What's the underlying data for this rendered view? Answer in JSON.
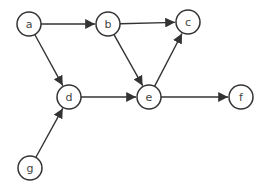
{
  "diagram": {
    "type": "directed-graph",
    "nodes": [
      {
        "id": "a",
        "label": "a",
        "x": 29,
        "y": 24
      },
      {
        "id": "b",
        "label": "b",
        "x": 108,
        "y": 24
      },
      {
        "id": "c",
        "label": "c",
        "x": 188,
        "y": 22
      },
      {
        "id": "d",
        "label": "d",
        "x": 69,
        "y": 97
      },
      {
        "id": "e",
        "label": "e",
        "x": 149,
        "y": 97
      },
      {
        "id": "f",
        "label": "f",
        "x": 241,
        "y": 97
      },
      {
        "id": "g",
        "label": "g",
        "x": 30,
        "y": 168
      }
    ],
    "edges": [
      {
        "from": "a",
        "to": "b"
      },
      {
        "from": "a",
        "to": "d"
      },
      {
        "from": "b",
        "to": "c"
      },
      {
        "from": "b",
        "to": "e"
      },
      {
        "from": "e",
        "to": "c"
      },
      {
        "from": "d",
        "to": "e"
      },
      {
        "from": "e",
        "to": "f"
      },
      {
        "from": "g",
        "to": "d"
      }
    ],
    "node_radius": 12,
    "colors": {
      "stroke": "#333333",
      "fill": "#ffffff",
      "label": "#444444"
    }
  }
}
